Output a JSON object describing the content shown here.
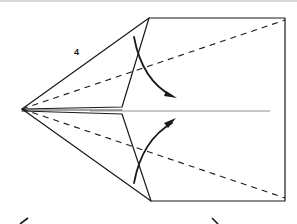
{
  "diagram": {
    "step_number": "4",
    "colors": {
      "line": "#1a1a1a",
      "background": "#ffffff",
      "shade": "#d8d8d8"
    },
    "elements": {
      "apex": [
        22,
        109
      ],
      "rectangle": {
        "top_left": [
          149,
          18
        ],
        "top_right": [
          285,
          18
        ],
        "bottom_right": [
          285,
          201
        ],
        "bottom_left": [
          151,
          201
        ]
      },
      "upper_flap_corner": [
        122,
        107
      ],
      "lower_flap_corner": [
        122,
        114
      ],
      "center_line": {
        "from": [
          90,
          111
        ],
        "to": [
          270,
          111
        ]
      },
      "valley_fold_lines": [
        {
          "from": [
            22,
            109
          ],
          "to": [
            285,
            20
          ],
          "style": "dashed"
        },
        {
          "from": [
            22,
            109
          ],
          "to": [
            285,
            198
          ],
          "style": "dashed"
        }
      ],
      "fold_arrows": [
        {
          "name": "upper-fold-arrow",
          "direction": "down",
          "curve": "from (135,38) to (175,98)"
        },
        {
          "name": "lower-fold-arrow",
          "direction": "up",
          "curve": "from (135,182) to (175,120)"
        }
      ],
      "bottom_arrows": [
        {
          "name": "left-arrow",
          "glyph": "<"
        },
        {
          "name": "right-arrow",
          "glyph": ">"
        }
      ]
    }
  }
}
